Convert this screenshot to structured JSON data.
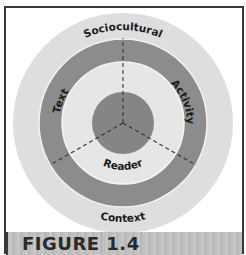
{
  "figure": {
    "caption": "FIGURE 1.4"
  },
  "diagram": {
    "type": "concentric-circles",
    "rings": [
      {
        "name": "context-ring",
        "label_top": "Sociocultural",
        "label_bottom": "Context",
        "color": "#dedede"
      },
      {
        "name": "middle-dark-ring",
        "color": "#8c8c8c"
      },
      {
        "name": "inner-light-ring",
        "labels": [
          "Text",
          "Activity",
          "Reader"
        ],
        "color": "#e6e6e6"
      },
      {
        "name": "core-circle",
        "color": "#858585"
      }
    ],
    "divider_color": "#333333",
    "labels": {
      "sociocultural": "Sociocultural",
      "context": "Context",
      "text": "Text",
      "activity": "Activity",
      "reader": "Reader"
    }
  }
}
